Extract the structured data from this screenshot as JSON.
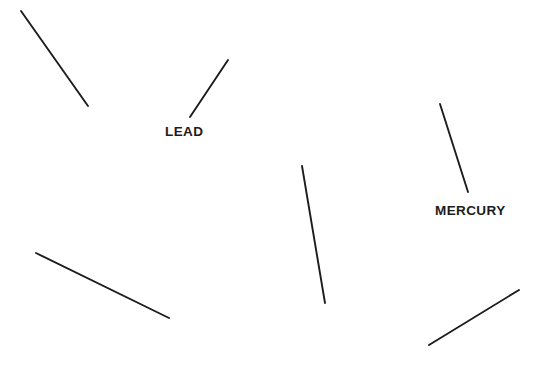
{
  "figure": {
    "canvas": {
      "width": 558,
      "height": 368,
      "background_color": "#ffffff"
    },
    "stroke_color": "#1c1c1c",
    "text_color": "#1c1c1c",
    "segments": [
      {
        "id": "segment-top-left",
        "name": "unlabeled-segment-1",
        "x1": 21,
        "y1": 11,
        "x2": 88,
        "y2": 106,
        "label": ""
      },
      {
        "id": "segment-lead",
        "name": "lead-segment",
        "x1": 190,
        "y1": 117,
        "x2": 228,
        "y2": 60,
        "label": "LEAD"
      },
      {
        "id": "segment-mercury",
        "name": "mercury-segment",
        "x1": 440,
        "y1": 104,
        "x2": 468,
        "y2": 192,
        "label": "MERCURY"
      },
      {
        "id": "segment-center",
        "name": "unlabeled-segment-2",
        "x1": 302,
        "y1": 166,
        "x2": 325,
        "y2": 303,
        "label": ""
      },
      {
        "id": "segment-lower-left",
        "name": "unlabeled-segment-3",
        "x1": 36,
        "y1": 253,
        "x2": 169,
        "y2": 318,
        "label": ""
      },
      {
        "id": "segment-bottom-right",
        "name": "unlabeled-segment-4",
        "x1": 429,
        "y1": 345,
        "x2": 519,
        "y2": 290,
        "label": ""
      }
    ],
    "labels": [
      {
        "id": "label-lead",
        "name": "lead-label",
        "text": "LEAD",
        "x": 165,
        "y": 136,
        "anchor": "start"
      },
      {
        "id": "label-mercury",
        "name": "mercury-label",
        "text": "MERCURY",
        "x": 435,
        "y": 215,
        "anchor": "start"
      }
    ]
  }
}
